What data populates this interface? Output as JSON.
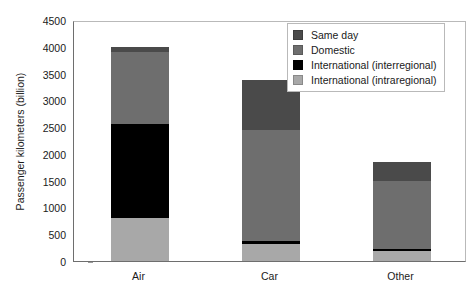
{
  "chart_data": {
    "type": "bar",
    "stacked": true,
    "title": "",
    "xlabel": "",
    "ylabel": "Passenger kilometers (billion)",
    "categories": [
      "Air",
      "Car",
      "Other"
    ],
    "ylim": [
      0,
      4500
    ],
    "ytick_step": 500,
    "yticks": [
      "4500",
      "4000",
      "3500",
      "3000",
      "2500",
      "2000",
      "1500",
      "1000",
      "500",
      "0"
    ],
    "grid": false,
    "legend_position": "top-right",
    "series": [
      {
        "name": "International (intraregional)",
        "color": "#a8a8a8",
        "values": [
          800,
          320,
          190
        ]
      },
      {
        "name": "International (interregional)",
        "color": "#000000",
        "values": [
          1750,
          50,
          40
        ]
      },
      {
        "name": "Domestic",
        "color": "#6e6e6e",
        "values": [
          1350,
          2080,
          1270
        ]
      },
      {
        "name": "Same day",
        "color": "#4a4a4a",
        "values": [
          100,
          930,
          350
        ]
      }
    ],
    "stack_order_bottom_to_top": [
      "International (intraregional)",
      "International (interregional)",
      "Domestic",
      "Same day"
    ],
    "totals": [
      4000,
      3380,
      1850
    ]
  },
  "legend": {
    "items": [
      {
        "label": "Same day",
        "color": "#4a4a4a"
      },
      {
        "label": "Domestic",
        "color": "#6e6e6e"
      },
      {
        "label": "International (interregional)",
        "color": "#000000"
      },
      {
        "label": "International (intraregional)",
        "color": "#a8a8a8"
      }
    ]
  },
  "axes": {
    "y_title": "Passenger kilometers (billion)",
    "axis_color": "#6e6e6e",
    "frame_color": "#b9b9b9"
  }
}
